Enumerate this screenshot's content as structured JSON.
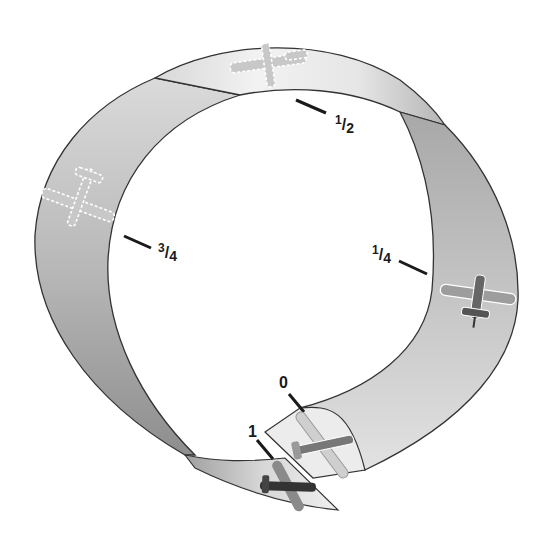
{
  "diagram": {
    "colors": {
      "ribbon_light": "#f4f4f4",
      "ribbon_mid": "#c8c8c8",
      "ribbon_dark": "#9a9a9a",
      "outline": "#333333",
      "tick": "#1a1a1a",
      "plane_solid": "#555555",
      "plane_ghost": "#bdbdbd"
    },
    "positions": [
      {
        "id": "p0",
        "num": "0",
        "is_fraction": false,
        "plane_style": "solid"
      },
      {
        "id": "p1",
        "num": "1",
        "is_fraction": false,
        "plane_style": "solid"
      },
      {
        "id": "p14",
        "num": "1",
        "den": "4",
        "is_fraction": true,
        "plane_style": "solid"
      },
      {
        "id": "p12",
        "num": "1",
        "den": "2",
        "is_fraction": true,
        "plane_style": "ghost"
      },
      {
        "id": "p34",
        "num": "3",
        "den": "4",
        "is_fraction": true,
        "plane_style": "ghost"
      }
    ],
    "slash": "/"
  }
}
